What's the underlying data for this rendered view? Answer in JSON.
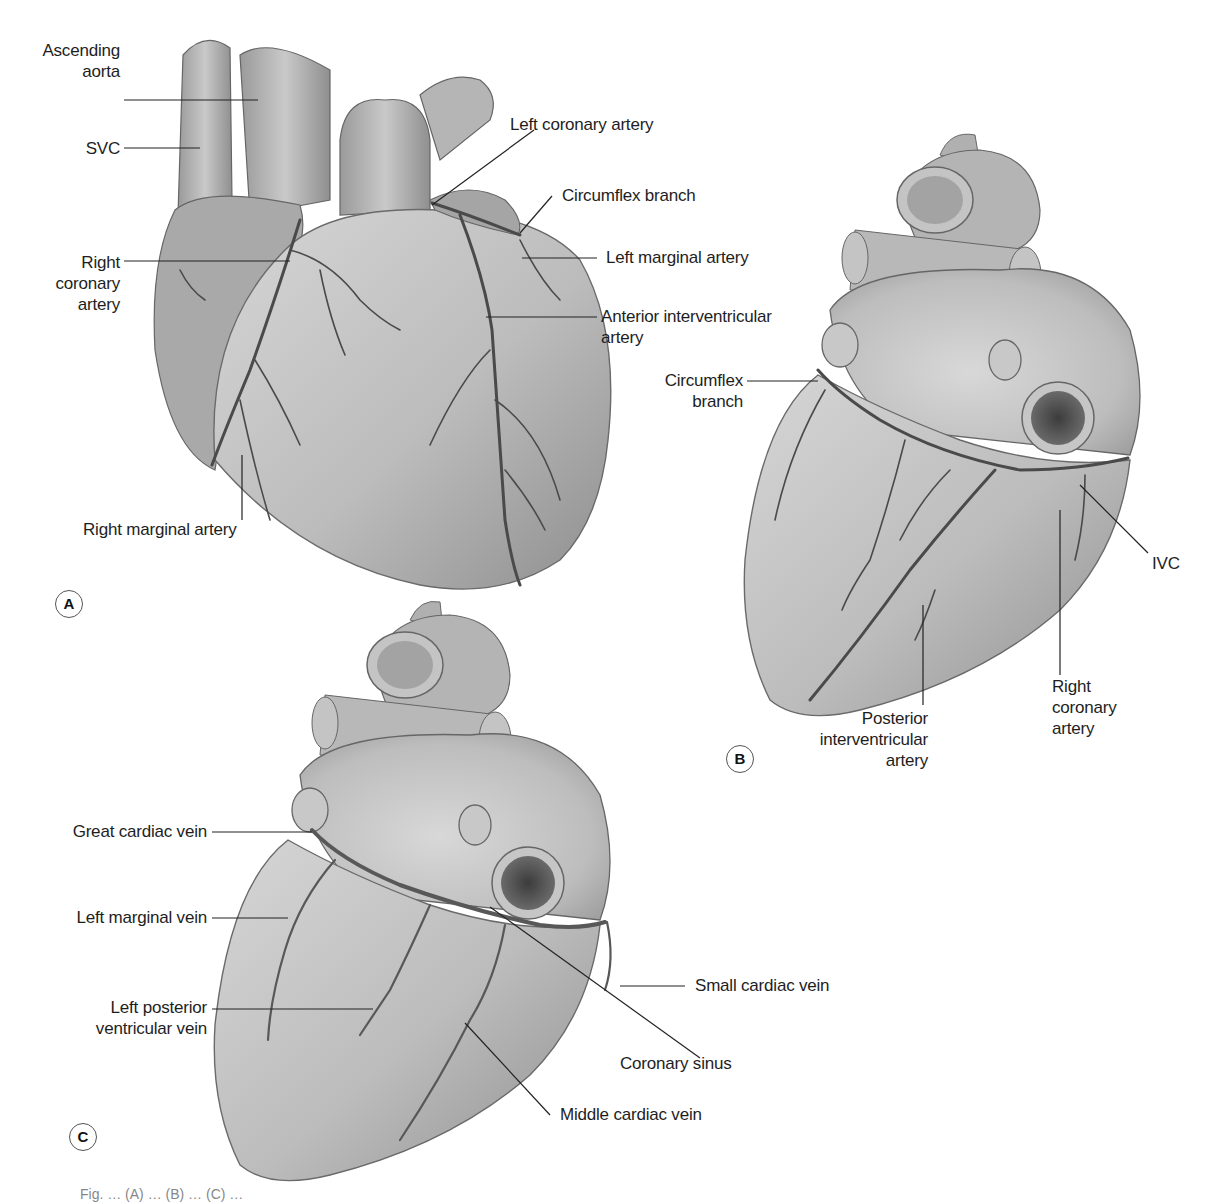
{
  "figure": {
    "panels": [
      {
        "tag": "A",
        "view": "anterior",
        "labels": {
          "ascending_aorta_l1": "Ascending",
          "ascending_aorta_l2": "aorta",
          "svc": "SVC",
          "right_coronary_l1": "Right",
          "right_coronary_l2": "coronary",
          "right_coronary_l3": "artery",
          "left_coronary": "Left coronary artery",
          "circumflex": "Circumflex branch",
          "left_marginal": "Left marginal artery",
          "anterior_iv_l1": "Anterior interventricular",
          "anterior_iv_l2": "artery",
          "right_marginal": "Right marginal artery"
        }
      },
      {
        "tag": "B",
        "view": "posterior-arteries",
        "labels": {
          "circumflex_l1": "Circumflex",
          "circumflex_l2": "branch",
          "ivc": "IVC",
          "right_coronary_l1": "Right",
          "right_coronary_l2": "coronary",
          "right_coronary_l3": "artery",
          "posterior_iv_l1": "Posterior",
          "posterior_iv_l2": "interventricular",
          "posterior_iv_l3": "artery"
        }
      },
      {
        "tag": "C",
        "view": "posterior-veins",
        "labels": {
          "great_cardiac": "Great cardiac vein",
          "left_marginal_vein": "Left marginal vein",
          "left_post_vent_l1": "Left posterior",
          "left_post_vent_l2": "ventricular vein",
          "small_cardiac": "Small cardiac vein",
          "coronary_sinus": "Coronary sinus",
          "middle_cardiac": "Middle cardiac vein"
        }
      }
    ],
    "caption": "Fig. …  (A) … (B) … (C) …",
    "colors": {
      "background": "#ffffff",
      "heart_fill": "#bdbdbd",
      "heart_light": "#d9d9d9",
      "heart_dark": "#8a8a8a",
      "vessel": "#4a4a4a",
      "leader_line": "#222222",
      "label_text": "#1e1e1e"
    }
  }
}
